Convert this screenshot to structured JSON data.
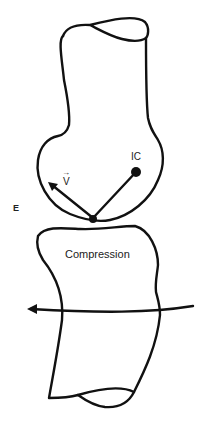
{
  "diagram": {
    "labels": {
      "side": "E",
      "instant_center": "IC",
      "velocity": "V",
      "velocity_arrow": "→",
      "contact": "Compression"
    },
    "colors": {
      "stroke": "#111111",
      "background": "#ffffff"
    }
  }
}
